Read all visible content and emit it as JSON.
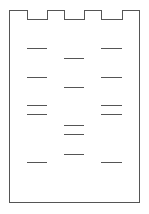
{
  "diagram": {
    "type": "gel-electrophoresis",
    "lanes": [
      {
        "name": "lane-1",
        "well": {
          "x": 27,
          "width": 19
        },
        "bands_y": [
          48,
          77,
          105,
          114,
          162
        ]
      },
      {
        "name": "lane-2",
        "well": {
          "x": 64,
          "width": 19
        },
        "bands_y": [
          58,
          87,
          125,
          134,
          154
        ]
      },
      {
        "name": "lane-3",
        "well": {
          "x": 101,
          "width": 20
        },
        "bands_y": [
          48,
          77,
          105,
          114,
          162
        ]
      }
    ],
    "colors": {
      "line": "#555555",
      "background": "#ffffff"
    }
  }
}
